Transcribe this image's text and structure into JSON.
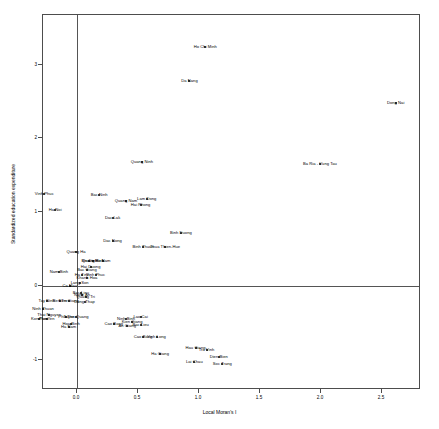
{
  "chart_data": {
    "type": "scatter",
    "title": "",
    "xlabel": "Local Moran's I",
    "ylabel": "Standardized education expenditure",
    "xlim": [
      -0.36,
      2.74
    ],
    "ylim": [
      -1.52,
      3.45
    ],
    "xticks": [
      0.0,
      0.5,
      1.0,
      1.5,
      2.0,
      2.5
    ],
    "xticklabels": [
      "0.0",
      "0.5",
      "1.0",
      "1.5",
      "2.0",
      "2.5"
    ],
    "yticks": [
      -1,
      0,
      1,
      2,
      3
    ],
    "yticklabels": [
      "-1",
      "0",
      "1",
      "2",
      "3"
    ],
    "grid": false,
    "legend": null,
    "reference_lines": {
      "vertical_x": 0.0,
      "horizontal_y": 0.0
    },
    "point_labels": true,
    "points": [
      {
        "label": "Ho Chi Minh",
        "x": 1.06,
        "y": 3.23
      },
      {
        "label": "Da Nang",
        "x": 0.93,
        "y": 2.76
      },
      {
        "label": "Dong Nai",
        "x": 2.62,
        "y": 2.47
      },
      {
        "label": "Ba Ria - Vung Tau",
        "x": 2.0,
        "y": 1.64
      },
      {
        "label": "Quang Ninh",
        "x": 0.54,
        "y": 1.66
      },
      {
        "label": "Vinh Phuc",
        "x": -0.26,
        "y": 1.23
      },
      {
        "label": "Bac Ninh",
        "x": 0.19,
        "y": 1.22
      },
      {
        "label": "Quang Nam",
        "x": 0.41,
        "y": 1.14
      },
      {
        "label": "Lam Dong",
        "x": 0.58,
        "y": 1.17
      },
      {
        "label": "Hai Phong",
        "x": 0.53,
        "y": 1.09
      },
      {
        "label": "Ha Noi",
        "x": -0.17,
        "y": 1.02
      },
      {
        "label": "Dac Lak",
        "x": 0.3,
        "y": 0.91
      },
      {
        "label": "Binh Duong",
        "x": 0.86,
        "y": 0.7
      },
      {
        "label": "Dac Nong",
        "x": 0.3,
        "y": 0.59
      },
      {
        "label": "Binh Thuan",
        "x": 0.55,
        "y": 0.51
      },
      {
        "label": "Thua Thien-Hue",
        "x": 0.73,
        "y": 0.52
      },
      {
        "label": "Quang Ha",
        "x": 0.0,
        "y": 0.45
      },
      {
        "label": "Bin Dinh",
        "x": 0.11,
        "y": 0.33
      },
      {
        "label": "Quang Binh",
        "x": 0.14,
        "y": 0.33
      },
      {
        "label": "Ha Nam",
        "x": 0.22,
        "y": 0.33
      },
      {
        "label": "Hai Duong",
        "x": 0.12,
        "y": 0.25
      },
      {
        "label": "Nam Binh",
        "x": -0.14,
        "y": 0.17
      },
      {
        "label": "Bac Giang",
        "x": 0.09,
        "y": 0.2
      },
      {
        "label": "Ha Tinh",
        "x": 0.05,
        "y": 0.14
      },
      {
        "label": "Vinh Phuc",
        "x": 0.16,
        "y": 0.14
      },
      {
        "label": "Khanh Hoa",
        "x": 0.09,
        "y": 0.09
      },
      {
        "label": "Lang Son",
        "x": 0.03,
        "y": 0.03
      },
      {
        "label": "Ca Mau",
        "x": -0.05,
        "y": -0.02
      },
      {
        "label": "Bac Lieu",
        "x": 0.04,
        "y": -0.11
      },
      {
        "label": "Nghe An",
        "x": 0.05,
        "y": -0.14
      },
      {
        "label": "Quang Tri",
        "x": 0.08,
        "y": -0.16
      },
      {
        "label": "Tay Ninh",
        "x": -0.24,
        "y": -0.22
      },
      {
        "label": "Ben Tre",
        "x": -0.13,
        "y": -0.22
      },
      {
        "label": "Tien Giang",
        "x": -0.06,
        "y": -0.22
      },
      {
        "label": "Dong Thap",
        "x": 0.07,
        "y": -0.23
      },
      {
        "label": "Ninh Thuan",
        "x": -0.27,
        "y": -0.33
      },
      {
        "label": "Thai Nguyen",
        "x": -0.22,
        "y": -0.4
      },
      {
        "label": "Kon Tum",
        "x": -0.3,
        "y": -0.46
      },
      {
        "label": "Phu Yen",
        "x": -0.24,
        "y": -0.46
      },
      {
        "label": "Phu Tho",
        "x": -0.08,
        "y": -0.44
      },
      {
        "label": "Tuyen Quang",
        "x": 0.0,
        "y": -0.44
      },
      {
        "label": "Lao Cai",
        "x": 0.53,
        "y": -0.44
      },
      {
        "label": "Ninh Binh",
        "x": 0.41,
        "y": -0.46
      },
      {
        "label": "Kien Giang",
        "x": 0.46,
        "y": -0.5
      },
      {
        "label": "Cao Bang",
        "x": 0.31,
        "y": -0.53
      },
      {
        "label": "An Giang",
        "x": 0.42,
        "y": -0.55
      },
      {
        "label": "Bac Lieu",
        "x": 0.53,
        "y": -0.54
      },
      {
        "label": "Hoa Binh",
        "x": -0.04,
        "y": -0.53
      },
      {
        "label": "Ha Nam",
        "x": -0.06,
        "y": -0.57
      },
      {
        "label": "Cao Bang",
        "x": 0.55,
        "y": -0.7
      },
      {
        "label": "Vinh Long",
        "x": 0.66,
        "y": -0.7
      },
      {
        "label": "Hau Giang",
        "x": 0.98,
        "y": -0.85
      },
      {
        "label": "Tra Vinh",
        "x": 1.07,
        "y": -0.88
      },
      {
        "label": "Ha Giang",
        "x": 0.69,
        "y": -0.94
      },
      {
        "label": "Dien Bien",
        "x": 1.17,
        "y": -0.98
      },
      {
        "label": "Lai Chau",
        "x": 0.97,
        "y": -1.04
      },
      {
        "label": "Soc Trang",
        "x": 1.2,
        "y": -1.07
      }
    ]
  }
}
